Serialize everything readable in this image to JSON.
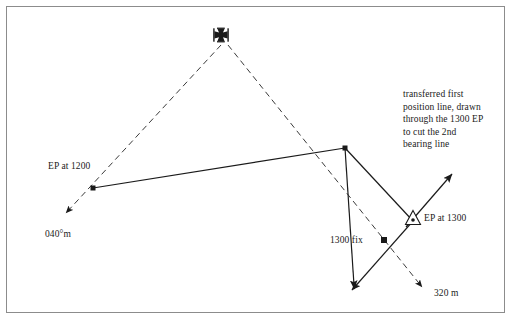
{
  "diagram": {
    "background_color": "#ffffff",
    "frame_color": "#8c8c8c",
    "ink_color": "#1a1a1a",
    "labels": {
      "transferred_note": "transferred first\nposition line, drawn\nthrough the 1300 EP\nto cut the 2nd\nbearing line",
      "ep_1200": "EP at 1200",
      "course_040": "040°m",
      "fix_1300": "1300 fix",
      "ep_1300": "EP at 1300",
      "distance_320": "320 m"
    },
    "symbols": {
      "landmark": "church-cross-symbol",
      "ep_marker": "triangle-estimated-position",
      "fix_marker": "filled-square-fix",
      "dot_marker": "filled-square-dot"
    },
    "points": {
      "landmark": [
        221,
        36
      ],
      "ep_1200": [
        93,
        188
      ],
      "transfer_corner": [
        345,
        148
      ],
      "ep_1300": [
        413,
        220
      ],
      "fix_1300": [
        384,
        240
      ],
      "arrow_040_tip": [
        63,
        216
      ],
      "arrow_320_tip": [
        425,
        290
      ],
      "arrow_bearing2_tip": [
        353,
        292
      ],
      "arrow_transferred_tip": [
        452,
        173
      ]
    },
    "lines": [
      {
        "name": "first-bearing-line",
        "style": "dashed",
        "from": "landmark",
        "to": "arrow_040_tip"
      },
      {
        "name": "second-bearing-line",
        "style": "dashed",
        "from": "landmark",
        "to": "arrow_320_tip"
      },
      {
        "name": "course-track-1200-to-1300",
        "style": "solid",
        "from": "ep_1200",
        "to": "transfer_corner"
      },
      {
        "name": "transferred-position-line",
        "style": "solid",
        "from": "transfer_corner",
        "to": "arrow_transferred_tip"
      },
      {
        "name": "run-to-fix-line",
        "style": "solid",
        "from": "transfer_corner",
        "to": "arrow_bearing2_tip"
      }
    ]
  }
}
